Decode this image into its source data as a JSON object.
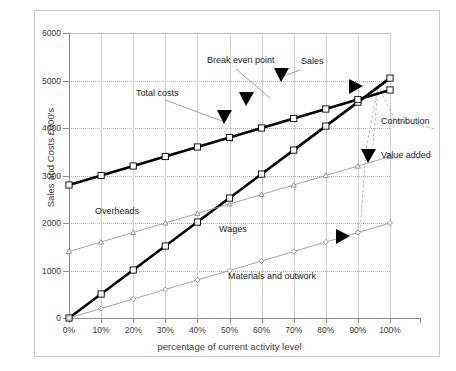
{
  "title": "Illustration 3 Break even chart",
  "chart_data": {
    "type": "line",
    "title": "Illustration 3 Break even chart",
    "xlabel": "percentage of current activity level",
    "ylabel": "Sales and Costs £000's",
    "categories": [
      "0%",
      "10%",
      "20%",
      "30%",
      "40%",
      "50%",
      "60%",
      "70%",
      "80%",
      "90%",
      "100%"
    ],
    "x": [
      0,
      10,
      20,
      30,
      40,
      50,
      60,
      70,
      80,
      90,
      100
    ],
    "xlim": [
      0,
      100
    ],
    "ylim": [
      0,
      6000
    ],
    "yticks": [
      0,
      1000,
      2000,
      3000,
      4000,
      5000,
      6000
    ],
    "grid": true,
    "legend": "none (series labelled inline)",
    "series": [
      {
        "name": "Sales",
        "marker": "square",
        "style": "thick-black",
        "values": [
          0,
          505,
          1010,
          1515,
          2020,
          2525,
          3030,
          3535,
          4040,
          4545,
          5050
        ]
      },
      {
        "name": "Total costs",
        "marker": "square",
        "style": "thick-black",
        "values": [
          2800,
          3000,
          3200,
          3400,
          3600,
          3800,
          4000,
          4200,
          4400,
          4600,
          4800
        ]
      },
      {
        "name": "Value added",
        "marker": "triangle",
        "style": "thin-grey",
        "values": [
          1400,
          1600,
          1800,
          2000,
          2200,
          2400,
          2600,
          2800,
          3000,
          3200,
          3400
        ]
      },
      {
        "name": "Materials and outwork",
        "marker": "diamond",
        "style": "thin-grey",
        "values": [
          0,
          200,
          400,
          600,
          800,
          1000,
          1200,
          1400,
          1600,
          1800,
          2000
        ]
      }
    ],
    "annotations": [
      {
        "label": "Break even point",
        "note": "sales crosses total costs near 90% / 4600"
      },
      {
        "label": "Sales",
        "note": "upper thick line endpoint at 100%"
      },
      {
        "label": "Total costs",
        "note": "thick line starting at 2800 at 0%"
      },
      {
        "label": "Overheads",
        "note": "area below total costs intercept"
      },
      {
        "label": "Wages",
        "note": "band between value added and materials lines"
      },
      {
        "label": "Materials and outwork",
        "note": "lowest diamond-marker line"
      },
      {
        "label": "Contribution",
        "note": "bracket at right edge between sales and materials"
      },
      {
        "label": "Value added",
        "note": "triangle-marker line label at right"
      }
    ]
  },
  "axes": {
    "y_tick_labels": [
      "6000",
      "5000",
      "4000",
      "3000",
      "2000",
      "1000",
      "0"
    ],
    "x_tick_labels": [
      "0%",
      "10%",
      "20%",
      "30%",
      "40%",
      "50%",
      "60%",
      "70%",
      "80%",
      "90%",
      "100%"
    ],
    "y_axis_title": "Sales and Costs £000's",
    "x_axis_title": "percentage of current activity level"
  },
  "annotations": {
    "break_even_point": "Break even point",
    "sales": "Sales",
    "total_costs": "Total costs",
    "overheads": "Overheads",
    "wages": "Wages",
    "materials": "Materials and outwork",
    "contribution": "Contribution",
    "value_added": "Value added"
  },
  "colors": {
    "heavy_line": "#000000",
    "light_line": "#9a9a9a",
    "gridline": "#8f96ad",
    "axis": "#8d8d8d",
    "frame": "#c9c9c9",
    "text": "#231f20",
    "background": "#ffffff"
  }
}
